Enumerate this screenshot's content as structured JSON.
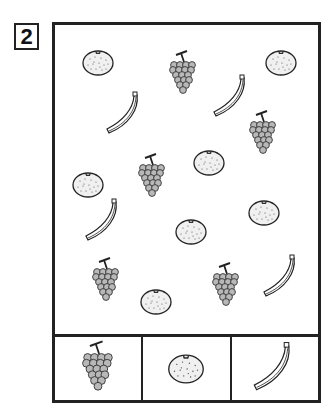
{
  "worksheet": {
    "number": "2",
    "scene_items": [
      {
        "type": "orange",
        "x": 98,
        "y": 63
      },
      {
        "type": "grapes",
        "x": 183,
        "y": 75
      },
      {
        "type": "orange",
        "x": 281,
        "y": 63
      },
      {
        "type": "banana",
        "x": 125,
        "y": 115
      },
      {
        "type": "banana",
        "x": 232,
        "y": 98
      },
      {
        "type": "grapes",
        "x": 263,
        "y": 135
      },
      {
        "type": "orange",
        "x": 88,
        "y": 185
      },
      {
        "type": "grapes",
        "x": 152,
        "y": 178
      },
      {
        "type": "orange",
        "x": 209,
        "y": 163
      },
      {
        "type": "banana",
        "x": 104,
        "y": 222
      },
      {
        "type": "orange",
        "x": 264,
        "y": 213
      },
      {
        "type": "orange",
        "x": 191,
        "y": 232
      },
      {
        "type": "grapes",
        "x": 106,
        "y": 282
      },
      {
        "type": "orange",
        "x": 156,
        "y": 302
      },
      {
        "type": "grapes",
        "x": 226,
        "y": 287
      },
      {
        "type": "banana",
        "x": 282,
        "y": 278
      }
    ],
    "key_cells": [
      {
        "type": "grapes",
        "label": "grapes"
      },
      {
        "type": "orange",
        "label": "orange"
      },
      {
        "type": "banana",
        "label": "banana"
      }
    ],
    "colors": {
      "line": "#222222",
      "grape": "#b8b8b8",
      "orange_fill": "#f0f0f0"
    }
  }
}
